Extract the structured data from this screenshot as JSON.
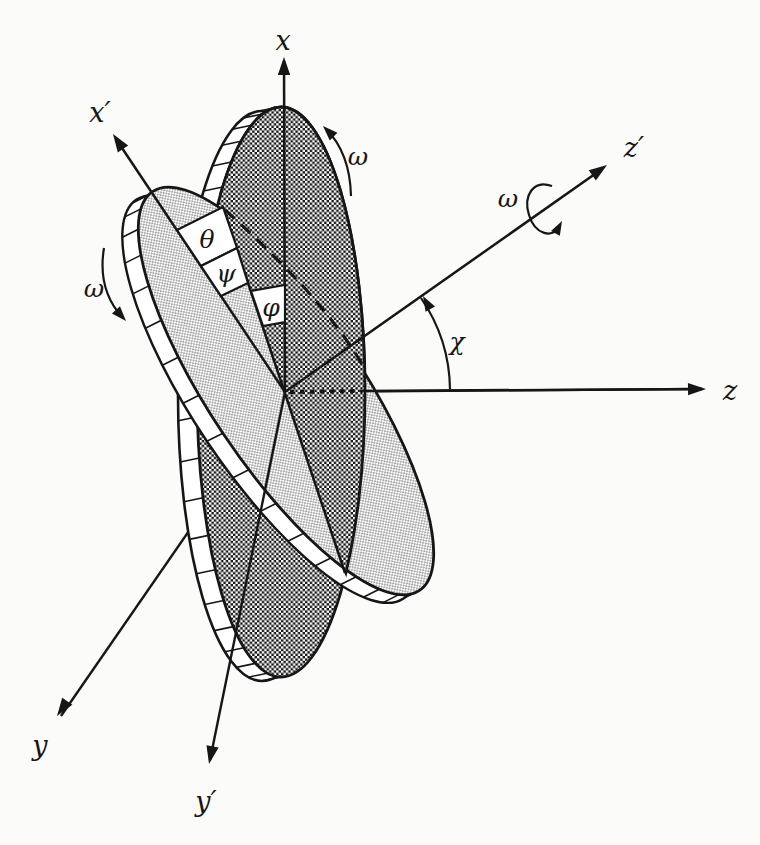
{
  "figure": {
    "background_color": "#fbfbf9",
    "ink_color": "#161616",
    "labels": {
      "x_axis": "x",
      "x_prime_axis": "x′",
      "y_axis": "y",
      "y_prime_axis": "y′",
      "z_axis": "z",
      "z_prime_axis": "z′",
      "omega_dark_disk": "ω",
      "omega_light_disk": "ω",
      "omega_spin_axis": "ω",
      "angle_theta": "θ",
      "angle_psi": "ψ",
      "angle_phi": "φ",
      "angle_chi": "χ"
    }
  }
}
